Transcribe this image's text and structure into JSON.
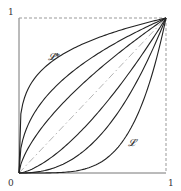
{
  "diagram": {
    "type": "curve-family-unit-square",
    "axis_ticks": {
      "y_top": "1",
      "origin": "0",
      "x_right": "1"
    },
    "labels": {
      "upper_curve": "𝓛*",
      "lower_curve": "𝓛"
    },
    "frame": {
      "left_edge": "solid",
      "bottom_edge": "solid",
      "top_edge": "dashed",
      "right_edge": "dashed"
    },
    "diagonal": "dash-dot",
    "curves_above_diagonal": 3,
    "curves_below_diagonal": 3,
    "colors": {
      "curve": "#222222",
      "frame": "#777777",
      "dashed": "#999999",
      "diagonal": "#aaaaaa"
    }
  }
}
